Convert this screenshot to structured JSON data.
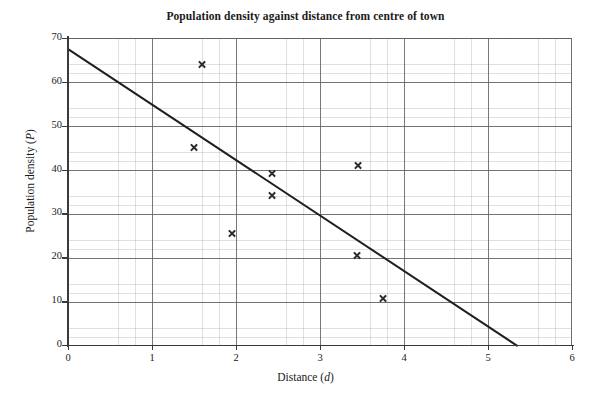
{
  "chart_data": {
    "type": "scatter",
    "title": "Population density against distance from centre of town",
    "xlabel": "Distance (d)",
    "xlabel_text": "Distance",
    "xlabel_symbol": "d",
    "ylabel": "Population density (P)",
    "ylabel_text": "Population density",
    "ylabel_symbol": "P",
    "xlim": [
      0,
      6
    ],
    "ylim": [
      0,
      70
    ],
    "xticks": [
      0,
      1,
      2,
      3,
      4,
      5,
      6
    ],
    "yticks": [
      0,
      10,
      20,
      30,
      40,
      50,
      60,
      70
    ],
    "xtick_labels": [
      "0",
      "1",
      "2",
      "3",
      "4",
      "5",
      "6"
    ],
    "ytick_labels": [
      "0",
      "10",
      "20",
      "30",
      "40",
      "50",
      "60",
      "70"
    ],
    "grid": true,
    "grid_major_step_x": 1,
    "grid_major_step_y": 10,
    "grid_minor_divisions": 5,
    "legend": null,
    "marker": "x",
    "marker_color": "#2b2b2b",
    "points": [
      {
        "x": 1.6,
        "y": 64.0
      },
      {
        "x": 1.5,
        "y": 45.0
      },
      {
        "x": 1.95,
        "y": 25.5
      },
      {
        "x": 2.43,
        "y": 39.0
      },
      {
        "x": 2.43,
        "y": 34.0
      },
      {
        "x": 3.45,
        "y": 41.0
      },
      {
        "x": 3.44,
        "y": 20.5
      },
      {
        "x": 3.75,
        "y": 10.5
      }
    ],
    "trend_line": {
      "label": "line of best fit",
      "color": "#1f1f1f",
      "x1": 0,
      "y1": 67.7,
      "x2": 5.35,
      "y2": 0
    }
  }
}
